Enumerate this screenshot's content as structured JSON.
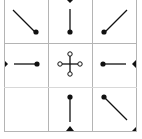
{
  "widget": {
    "title": "Anchor position selector",
    "line_color": "#b4b4b4",
    "icon_color": "#111111"
  },
  "cells": [
    {
      "id": "top-left",
      "label": "Top Left",
      "direction": "up-left",
      "icon": "arrow-top-left-icon"
    },
    {
      "id": "top-center",
      "label": "Top Center",
      "direction": "up",
      "icon": "arrow-top-icon"
    },
    {
      "id": "top-right",
      "label": "Top Right",
      "direction": "up-right",
      "icon": "arrow-top-right-icon"
    },
    {
      "id": "middle-left",
      "label": "Middle Left",
      "direction": "left",
      "icon": "arrow-left-icon"
    },
    {
      "id": "center",
      "label": "Center",
      "direction": "center",
      "icon": "move-center-icon"
    },
    {
      "id": "middle-right",
      "label": "Middle Right",
      "direction": "right",
      "icon": "arrow-right-icon"
    },
    {
      "id": "bottom-left",
      "label": "Bottom Left",
      "direction": "none",
      "icon": "empty"
    },
    {
      "id": "bottom-center",
      "label": "Bottom Center",
      "direction": "down",
      "icon": "arrow-bottom-icon"
    },
    {
      "id": "bottom-right",
      "label": "Bottom Right",
      "direction": "down-right",
      "icon": "arrow-bottom-right-icon"
    }
  ]
}
